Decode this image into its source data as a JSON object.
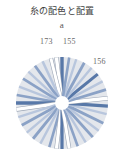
{
  "figure": {
    "title": "糸の配色と配置",
    "panel_label": "a",
    "type": "radial-spoke-diagram",
    "background_color": "#ffffff",
    "disc": {
      "fill_color": "#e4e7ec",
      "center_hub_color": "#ffffff",
      "center_x": 46,
      "center_y": 47,
      "radius": 46,
      "hub_radius": 7
    },
    "annotations": [
      {
        "name": "label-173",
        "text": "173",
        "points_to": "white-spoke-upper-left-of-top",
        "x": 40,
        "y": 37
      },
      {
        "name": "label-155",
        "text": "155",
        "points_to": "blue-spoke-top",
        "x": 63,
        "y": 37
      },
      {
        "name": "label-156",
        "text": "156",
        "points_to": "blue-spoke-upper-right",
        "x": 93,
        "y": 57
      }
    ],
    "colors": {
      "thread_blue_dark": "#5878a8",
      "thread_blue_mid": "#8ba2c6",
      "thread_blue_light": "#b8c6dd",
      "thread_white": "#ffffff",
      "thread_outline": "#9aa4b4",
      "disc_fill": "#e4e7ec",
      "text_gray": "#6a6a6a",
      "title_gray": "#3e3e3e"
    },
    "spokes": [
      {
        "index": 0,
        "angle_deg": -90,
        "color": "#5878a8",
        "width": 3.4,
        "kind": "blue-dark"
      },
      {
        "index": 1,
        "angle_deg": -97,
        "color": "#ffffff",
        "width": 3.4,
        "kind": "white"
      },
      {
        "index": 2,
        "angle_deg": -104,
        "color": "#ffffff",
        "width": 3.0,
        "kind": "white"
      },
      {
        "index": 3,
        "angle_deg": -115,
        "color": "#b8c6dd",
        "width": 2.6,
        "kind": "blue-light"
      },
      {
        "index": 4,
        "angle_deg": -126,
        "color": "#8ba2c6",
        "width": 2.8,
        "kind": "blue-mid"
      },
      {
        "index": 5,
        "angle_deg": -137,
        "color": "#b8c6dd",
        "width": 2.4,
        "kind": "blue-light"
      },
      {
        "index": 6,
        "angle_deg": -148,
        "color": "#8ba2c6",
        "width": 2.8,
        "kind": "blue-mid"
      },
      {
        "index": 7,
        "angle_deg": -159,
        "color": "#b8c6dd",
        "width": 2.4,
        "kind": "blue-light"
      },
      {
        "index": 8,
        "angle_deg": -170,
        "color": "#8ba2c6",
        "width": 2.6,
        "kind": "blue-mid"
      },
      {
        "index": 9,
        "angle_deg": 180,
        "color": "#5878a8",
        "width": 3.4,
        "kind": "blue-dark"
      },
      {
        "index": 10,
        "angle_deg": 172,
        "color": "#ffffff",
        "width": 3.4,
        "kind": "white"
      },
      {
        "index": 11,
        "angle_deg": 162,
        "color": "#b8c6dd",
        "width": 2.4,
        "kind": "blue-light"
      },
      {
        "index": 12,
        "angle_deg": 151,
        "color": "#8ba2c6",
        "width": 2.8,
        "kind": "blue-mid"
      },
      {
        "index": 13,
        "angle_deg": 140,
        "color": "#b8c6dd",
        "width": 2.4,
        "kind": "blue-light"
      },
      {
        "index": 14,
        "angle_deg": 129,
        "color": "#8ba2c6",
        "width": 2.8,
        "kind": "blue-mid"
      },
      {
        "index": 15,
        "angle_deg": 118,
        "color": "#b8c6dd",
        "width": 2.4,
        "kind": "blue-light"
      },
      {
        "index": 16,
        "angle_deg": 106,
        "color": "#8ba2c6",
        "width": 2.6,
        "kind": "blue-mid"
      },
      {
        "index": 17,
        "angle_deg": 97,
        "color": "#ffffff",
        "width": 3.2,
        "kind": "white"
      },
      {
        "index": 18,
        "angle_deg": 90,
        "color": "#5878a8",
        "width": 3.2,
        "kind": "blue-dark"
      },
      {
        "index": 19,
        "angle_deg": 81,
        "color": "#ffffff",
        "width": 3.0,
        "kind": "white"
      },
      {
        "index": 20,
        "angle_deg": 70,
        "color": "#8ba2c6",
        "width": 2.6,
        "kind": "blue-mid"
      },
      {
        "index": 21,
        "angle_deg": 59,
        "color": "#b8c6dd",
        "width": 2.4,
        "kind": "blue-light"
      },
      {
        "index": 22,
        "angle_deg": 48,
        "color": "#8ba2c6",
        "width": 2.8,
        "kind": "blue-mid"
      },
      {
        "index": 23,
        "angle_deg": 37,
        "color": "#b8c6dd",
        "width": 2.4,
        "kind": "blue-light"
      },
      {
        "index": 24,
        "angle_deg": 26,
        "color": "#8ba2c6",
        "width": 2.8,
        "kind": "blue-mid"
      },
      {
        "index": 25,
        "angle_deg": 14,
        "color": "#b8c6dd",
        "width": 2.4,
        "kind": "blue-light"
      },
      {
        "index": 26,
        "angle_deg": 4,
        "color": "#5878a8",
        "width": 3.2,
        "kind": "blue-dark"
      },
      {
        "index": 27,
        "angle_deg": -6,
        "color": "#ffffff",
        "width": 3.4,
        "kind": "white"
      },
      {
        "index": 28,
        "angle_deg": -17,
        "color": "#8ba2c6",
        "width": 2.8,
        "kind": "blue-mid"
      },
      {
        "index": 29,
        "angle_deg": -28,
        "color": "#b8c6dd",
        "width": 2.4,
        "kind": "blue-light"
      },
      {
        "index": 30,
        "angle_deg": -39,
        "color": "#5878a8",
        "width": 3.0,
        "kind": "blue-dark"
      },
      {
        "index": 31,
        "angle_deg": -50,
        "color": "#b8c6dd",
        "width": 2.4,
        "kind": "blue-light"
      },
      {
        "index": 32,
        "angle_deg": -61,
        "color": "#8ba2c6",
        "width": 2.8,
        "kind": "blue-mid"
      },
      {
        "index": 33,
        "angle_deg": -72,
        "color": "#b8c6dd",
        "width": 2.4,
        "kind": "blue-light"
      },
      {
        "index": 34,
        "angle_deg": -81,
        "color": "#8ba2c6",
        "width": 2.6,
        "kind": "blue-mid"
      }
    ]
  }
}
